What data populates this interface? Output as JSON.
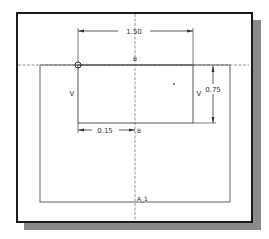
{
  "diagram": {
    "type": "cad-sketch",
    "dimensions": {
      "top_width": "1.50",
      "right_height": "0.75",
      "bottom_offset": "0.15"
    },
    "constraint_labels": {
      "left_vertical": "V",
      "right_vertical": "V",
      "top_midpoint": "B",
      "bottom_midpoint": "B",
      "base_label": "A_1"
    },
    "colors": {
      "frame_border": "#1a1a1a",
      "shadow": "#8a8a8a",
      "geometry": "#555555",
      "centerline": "#777777",
      "text": "#333333"
    }
  }
}
